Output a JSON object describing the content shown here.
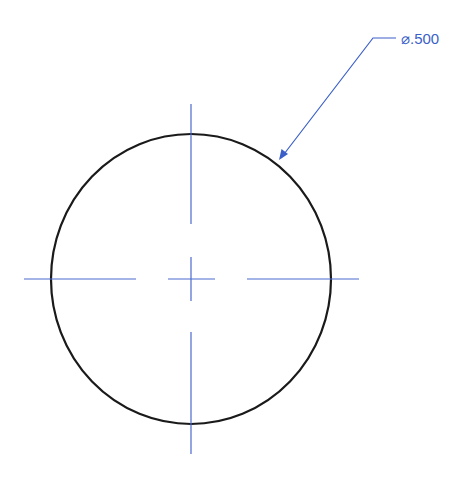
{
  "drawing": {
    "type": "engineering-drawing",
    "view": "circle-with-centerlines",
    "dimension": {
      "label": "⌀.500",
      "kind": "diameter",
      "value": ".500"
    },
    "colors": {
      "background": "#ffffff",
      "outline": "#1a1a1a",
      "centerline": "#4a6ad0",
      "dimension": "#3a5fc8"
    },
    "geometry": {
      "center": [
        191,
        279
      ],
      "rx": 140,
      "ry": 145,
      "leader": {
        "tip": [
          279,
          160
        ],
        "bend": [
          373,
          38
        ],
        "shoulder_end": [
          396,
          38
        ],
        "text_at": [
          401,
          44
        ]
      }
    }
  }
}
